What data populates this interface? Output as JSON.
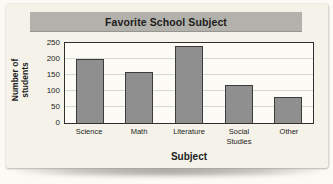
{
  "title": "Favorite School Subject",
  "chart_data": {
    "type": "bar",
    "title": "Favorite School Subject",
    "categories": [
      "Science",
      "Math",
      "Literature",
      "Social Studies",
      "Other"
    ],
    "values": [
      200,
      160,
      240,
      120,
      80
    ],
    "xlabel": "Subject",
    "ylabel": "Number of students",
    "ylim": [
      0,
      250
    ],
    "y_ticks": [
      0,
      50,
      100,
      150,
      200,
      250
    ],
    "grid": true,
    "legend": "none"
  },
  "colors": {
    "card_bg": "#f5f3e9",
    "titlebar_bg": "#b2b1ab",
    "plot_bg": "#fcfbf5",
    "gridline": "#d5d8d0",
    "bar_fill": "#8f8f8f",
    "bar_border": "#3c3c3c",
    "text": "#1c1c1c"
  }
}
